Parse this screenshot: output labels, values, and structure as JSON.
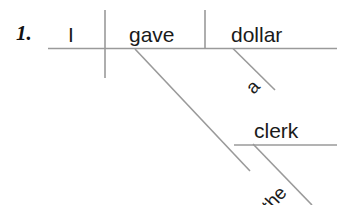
{
  "exercise": {
    "number_label": "1.",
    "sentence": "I gave the clerk a dollar",
    "type": "reed-kellogg-sentence-diagram"
  },
  "diagram": {
    "subject": "I",
    "verb": "gave",
    "direct_object": "dollar",
    "direct_object_article": "a",
    "indirect_object": "clerk",
    "indirect_object_article": "the",
    "line_color": "#9a9a9a",
    "text_color": "#1a1a1a",
    "background_color": "#ffffff"
  },
  "geometry": {
    "baseline": {
      "x1": 48,
      "y1": 48.5,
      "x2": 337,
      "y2": 48.5
    },
    "subject_verb_divider": {
      "x1": 105,
      "y1": 10,
      "x2": 105,
      "y2": 78
    },
    "verb_object_divider": {
      "x1": 205,
      "y1": 10,
      "x2": 205,
      "y2": 48.5
    },
    "dobj_article_slant": {
      "x1": 233,
      "y1": 48.5,
      "x2": 275,
      "y2": 90
    },
    "iobj_connector_slant": {
      "x1": 135,
      "y1": 49,
      "x2": 250,
      "y2": 171
    },
    "iobj_baseline": {
      "x1": 234,
      "y1": 145,
      "x2": 337,
      "y2": 145
    },
    "iobj_article_slant": {
      "x1": 253,
      "y1": 144,
      "x2": 312,
      "y2": 205
    }
  }
}
